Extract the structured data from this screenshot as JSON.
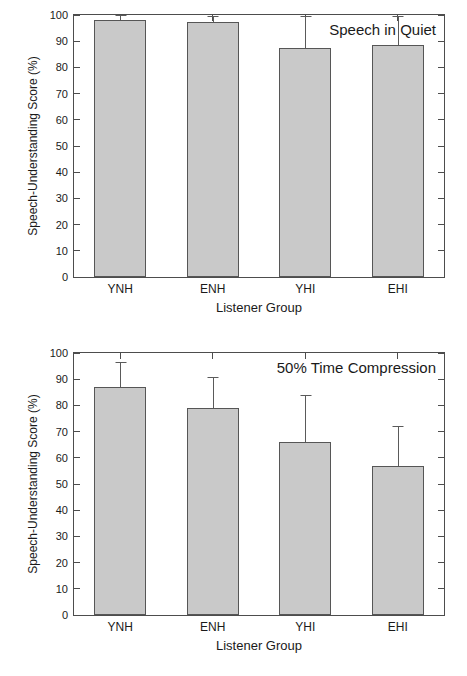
{
  "figure": {
    "axis_title_x": "Listener Group",
    "axis_title_y": "Speech-Understanding Score (%)",
    "bar_fill_color": "#c9c9c9",
    "bar_edge_color": "#565656",
    "axis_color": "#4d4d4d",
    "background_color": "#ffffff"
  },
  "chart_data": [
    {
      "type": "bar",
      "title": "Speech in Quiet",
      "xlabel": "Listener Group",
      "ylabel": "Speech-Understanding Score (%)",
      "categories": [
        "YNH",
        "ENH",
        "YHI",
        "EHI"
      ],
      "values": [
        98,
        97.5,
        87.5,
        88.5
      ],
      "errors": [
        2,
        2,
        12,
        11
      ],
      "ylim": [
        0,
        100
      ],
      "yticks": [
        0,
        10,
        20,
        30,
        40,
        50,
        60,
        70,
        80,
        90,
        100
      ],
      "ytick_labels": [
        "0",
        "10",
        "20",
        "30",
        "40",
        "50",
        "60",
        "70",
        "80",
        "90",
        "100"
      ],
      "grid": false,
      "legend": "none",
      "error_bar_direction": "upper-only"
    },
    {
      "type": "bar",
      "title": "50% Time Compression",
      "xlabel": "Listener Group",
      "ylabel": "Speech-Understanding Score (%)",
      "categories": [
        "YNH",
        "ENH",
        "YHI",
        "EHI"
      ],
      "values": [
        87,
        79,
        66,
        57
      ],
      "errors": [
        9.5,
        12,
        18,
        15
      ],
      "ylim": [
        0,
        100
      ],
      "yticks": [
        0,
        10,
        20,
        30,
        40,
        50,
        60,
        70,
        80,
        90,
        100
      ],
      "ytick_labels": [
        "0",
        "10",
        "20",
        "30",
        "40",
        "50",
        "60",
        "70",
        "80",
        "90",
        "100"
      ],
      "grid": false,
      "legend": "none",
      "error_bar_direction": "upper-only"
    }
  ]
}
